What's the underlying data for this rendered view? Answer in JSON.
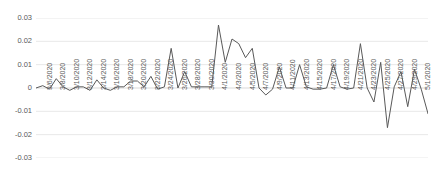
{
  "chart_data": {
    "type": "line",
    "title": "",
    "subtitle": "",
    "xlabel": "",
    "ylabel": "",
    "ylim": [
      -0.03,
      0.03
    ],
    "ytick_labels": [
      "0.03",
      "0.02",
      "0.01",
      "0",
      "-0.01",
      "-0.02",
      "-0.03"
    ],
    "ytick_values": [
      0.03,
      0.02,
      0.01,
      0,
      -0.01,
      -0.02,
      -0.03
    ],
    "grid": true,
    "grid_axis": "y",
    "legend": false,
    "legend_position": "none",
    "line_color": "#595959",
    "grid_color": "#e8e8e8",
    "zero_line_color": "#d9d9d9",
    "xtick_labels": [
      "3/6/2020",
      "3/8/2020",
      "3/10/2020",
      "3/12/2020",
      "3/14/2020",
      "3/16/2020",
      "3/18/2020",
      "3/20/2020",
      "3/22/2020",
      "3/24/2020",
      "3/26/2020",
      "3/28/2020",
      "3/30/2020",
      "4/1/2020",
      "4/3/2020",
      "4/5/2020",
      "4/7/2020",
      "4/9/2020",
      "4/11/2020",
      "4/13/2020",
      "4/15/2020",
      "4/17/2020",
      "4/19/2020",
      "4/21/2020",
      "4/23/2020",
      "4/25/2020",
      "4/27/2020",
      "4/29/2020",
      "5/1/2020"
    ],
    "x": [
      "3/5/2020",
      "3/6/2020",
      "3/7/2020",
      "3/8/2020",
      "3/9/2020",
      "3/10/2020",
      "3/11/2020",
      "3/12/2020",
      "3/13/2020",
      "3/14/2020",
      "3/15/2020",
      "3/16/2020",
      "3/17/2020",
      "3/18/2020",
      "3/19/2020",
      "3/20/2020",
      "3/21/2020",
      "3/22/2020",
      "3/23/2020",
      "3/24/2020",
      "3/25/2020",
      "3/26/2020",
      "3/27/2020",
      "3/28/2020",
      "3/29/2020",
      "3/30/2020",
      "3/31/2020",
      "4/1/2020",
      "4/2/2020",
      "4/3/2020",
      "4/4/2020",
      "4/5/2020",
      "4/6/2020",
      "4/7/2020",
      "4/8/2020",
      "4/9/2020",
      "4/10/2020",
      "4/11/2020",
      "4/12/2020",
      "4/13/2020",
      "4/14/2020",
      "4/15/2020",
      "4/16/2020",
      "4/17/2020",
      "4/18/2020",
      "4/19/2020",
      "4/20/2020",
      "4/21/2020",
      "4/22/2020",
      "4/23/2020",
      "4/24/2020",
      "4/25/2020",
      "4/26/2020",
      "4/27/2020",
      "4/28/2020",
      "4/29/2020",
      "4/30/2020",
      "5/1/2020",
      "5/2/2020"
    ],
    "values": [
      0.0,
      0.001,
      -0.0005,
      0.004,
      0.0005,
      -0.001,
      0.0005,
      0.0005,
      -0.001,
      0.0035,
      0.0,
      -0.001,
      0.0005,
      0.0005,
      0.003,
      0.003,
      0.0005,
      0.005,
      -0.0005,
      0.0005,
      0.017,
      0.0,
      0.007,
      0.0005,
      0.0005,
      0.0005,
      0.0005,
      0.027,
      0.011,
      0.021,
      0.019,
      0.013,
      0.017,
      0.0,
      -0.003,
      -0.0005,
      0.009,
      0.0,
      0.0,
      0.01,
      0.0005,
      -0.0005,
      -0.0005,
      0.0,
      0.01,
      0.0005,
      -0.0005,
      0.0,
      0.019,
      0.0,
      -0.006,
      0.011,
      -0.017,
      0.0005,
      0.007,
      -0.008,
      0.008,
      -0.0005,
      -0.011
    ]
  }
}
